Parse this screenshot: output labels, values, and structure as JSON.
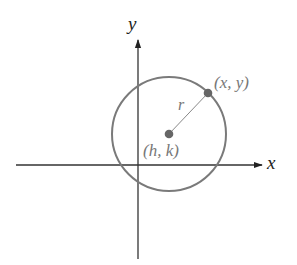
{
  "diagram": {
    "title": "",
    "axes": {
      "x_label": "x",
      "y_label": "y",
      "origin_px": [
        138,
        165
      ],
      "x_axis_px": {
        "x1": 16,
        "x2": 262,
        "y": 165
      },
      "y_axis_px": {
        "x": 138,
        "y1": 40,
        "y2": 259
      }
    },
    "circle": {
      "center_px": [
        169,
        134
      ],
      "radius_px": 57,
      "stroke_color": "#7a7a7a"
    },
    "points": {
      "center": {
        "label": "(h, k)",
        "px": [
          169,
          134
        ]
      },
      "on_circle": {
        "label": "(x, y)",
        "px": [
          208,
          93
        ]
      }
    },
    "radius_segment": {
      "label": "r"
    },
    "colors": {
      "axis": "#222222",
      "circle": "#7a7a7a",
      "point_fill": "#666666",
      "label": "#777777",
      "radius_line": "#888888"
    }
  }
}
